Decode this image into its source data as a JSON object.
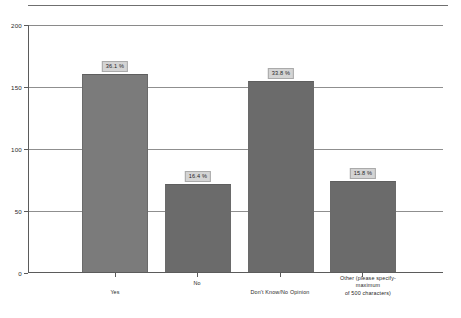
{
  "chart_data": {
    "type": "bar",
    "title": "",
    "subtitle": "",
    "xlabel": "",
    "ylabel": "",
    "ylim": [
      0,
      200
    ],
    "grid": true,
    "legend": "none",
    "y_ticks": [
      {
        "value": 200,
        "label": "200"
      },
      {
        "value": 150,
        "label": "150"
      },
      {
        "value": 100,
        "label": "100"
      },
      {
        "value": 50,
        "label": "50"
      },
      {
        "value": 0,
        "label": "0"
      }
    ],
    "categories": [
      "Yes",
      "No",
      "Don't Know/No Opinion",
      "Other (please specify-maximum\nof 500 characters)"
    ],
    "values": [
      160,
      71,
      154,
      73
    ],
    "data_labels": [
      "36.1 %",
      "16.4 %",
      "33.8 %",
      "15.8 %"
    ],
    "series": [
      {
        "name": "Responses",
        "values": [
          160,
          71,
          154,
          73
        ],
        "data_labels": [
          "36.1 %",
          "16.4 %",
          "33.8 %",
          "15.8 %"
        ]
      }
    ]
  },
  "colors": {
    "bar_light": "#7b7b7b",
    "bar_dark": "#6b6b6b",
    "axis": "#5b5b5b",
    "grid": "#8f8f8f",
    "label_box_fill": "#d4d4d4",
    "label_box_border": "#a9a9a9",
    "text": "#1f1f1f",
    "background": "#ffffff"
  }
}
